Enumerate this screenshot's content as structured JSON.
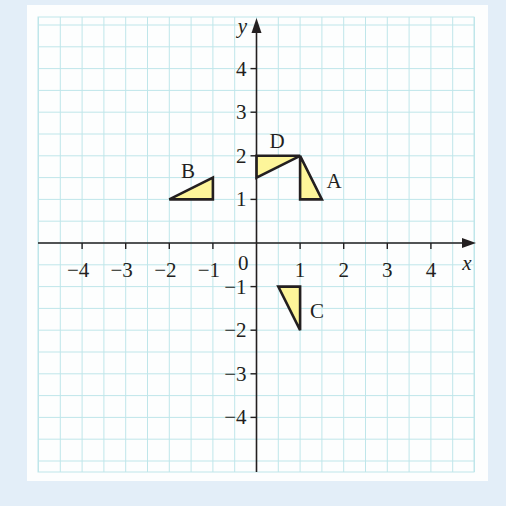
{
  "chart_data": {
    "type": "scatter",
    "title": "",
    "xlabel": "x",
    "ylabel": "y",
    "xlim": [
      -4.5,
      4.5
    ],
    "ylim": [
      -5,
      5
    ],
    "grid": true,
    "grid_step": 0.5,
    "x_ticks": [
      "-4",
      "-3",
      "-2",
      "-1",
      "0",
      "1",
      "2",
      "3",
      "4"
    ],
    "y_ticks": [
      "4",
      "3",
      "2",
      "1",
      "-1",
      "-2",
      "-3",
      "-4"
    ],
    "origin_label": "0",
    "shapes": [
      {
        "label": "A",
        "type": "triangle",
        "vertices": [
          [
            1,
            2
          ],
          [
            1,
            1
          ],
          [
            1.5,
            1
          ]
        ],
        "fill": "#fdf59a"
      },
      {
        "label": "B",
        "type": "triangle",
        "vertices": [
          [
            -2,
            1
          ],
          [
            -1,
            1
          ],
          [
            -1,
            1.5
          ]
        ],
        "fill": "#fdf59a"
      },
      {
        "label": "C",
        "type": "triangle",
        "vertices": [
          [
            0.5,
            -1
          ],
          [
            1,
            -1
          ],
          [
            1,
            -2
          ]
        ],
        "fill": "#fdf59a"
      },
      {
        "label": "D",
        "type": "triangle",
        "vertices": [
          [
            0,
            2
          ],
          [
            1,
            2
          ],
          [
            0,
            1.5
          ]
        ],
        "fill": "#fdf59a"
      }
    ]
  },
  "labels": {
    "x_axis": "x",
    "y_axis": "y",
    "origin": "0",
    "shape_a": "A",
    "shape_b": "B",
    "shape_c": "C",
    "shape_d": "D"
  },
  "colors": {
    "background": "#e3eef8",
    "panel": "#fdfefe",
    "grid": "#bfe6ea",
    "axis": "#231f20",
    "shape_fill": "#fdf59a"
  }
}
